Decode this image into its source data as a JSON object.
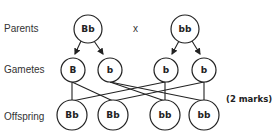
{
  "row_labels": {
    "parents": "Parents",
    "gametes": "Gametes",
    "offspring": "Offspring"
  },
  "cross_symbol": "x",
  "parents": [
    {
      "genotype": "Bb"
    },
    {
      "genotype": "bb"
    }
  ],
  "gametes": [
    {
      "allele": "B"
    },
    {
      "allele": "b"
    },
    {
      "allele": "b"
    },
    {
      "allele": "b"
    }
  ],
  "offspring": [
    {
      "genotype": "Bb"
    },
    {
      "genotype": "Bb"
    },
    {
      "genotype": "bb"
    },
    {
      "genotype": "bb"
    }
  ],
  "marks_label": "(2 marks)",
  "colors": {
    "stroke": "#222222",
    "text": "#333333",
    "background": "#ffffff"
  }
}
